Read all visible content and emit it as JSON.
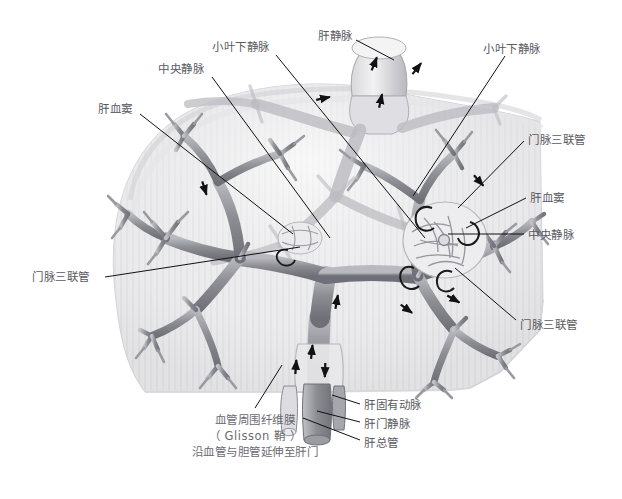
{
  "figure": {
    "background_color": "#ffffff",
    "ink_color": "#5a5a5f",
    "vessel_color": "#8a8a90"
  },
  "labels": [
    {
      "id": "central-vein-top",
      "text": "中央静脉",
      "x": 158,
      "y": 62,
      "leader": "M 212,77 L 330,238"
    },
    {
      "id": "sublobular-vein-top",
      "text": "小叶下静脉",
      "x": 212,
      "y": 40,
      "leader": "M 276,55 L 425,238"
    },
    {
      "id": "hepatic-vein",
      "text": "肝静脉",
      "x": 318,
      "y": 29,
      "leader": "M 356,40 L 394,60"
    },
    {
      "id": "sublobular-vein-right",
      "text": "小叶下静脉",
      "x": 483,
      "y": 42,
      "leader": "M 505,56 L 413,196"
    },
    {
      "id": "hepatic-sinusoid-left",
      "text": "肝血窦",
      "x": 98,
      "y": 102,
      "leader": "M 140,114 L 293,234"
    },
    {
      "id": "portal-triad-right-top",
      "text": "门脉三联管",
      "x": 528,
      "y": 133,
      "leader": "M 524,141 L 458,208"
    },
    {
      "id": "hepatic-sinusoid-right",
      "text": "肝血窦",
      "x": 530,
      "y": 191,
      "leader": "M 526,198 L 466,228"
    },
    {
      "id": "central-vein-right",
      "text": "中央静脉",
      "x": 528,
      "y": 228,
      "leader": "M 524,234 L 448,234"
    },
    {
      "id": "portal-triad-left",
      "text": "门脉三联管",
      "x": 32,
      "y": 270,
      "leader": "M 105,277 L 300,247"
    },
    {
      "id": "portal-triad-right-bot",
      "text": "门脉三联管",
      "x": 520,
      "y": 318,
      "leader": "M 516,320 L 455,268"
    },
    {
      "id": "proper-hepatic-artery",
      "text": "肝固有动脉",
      "x": 364,
      "y": 398,
      "leader": "M 360,404 L 332,395"
    },
    {
      "id": "hepatic-portal-vein",
      "text": "肝门静脉",
      "x": 364,
      "y": 417,
      "leader": "M 360,422 L 317,411"
    },
    {
      "id": "common-hepatic-duct",
      "text": "肝总管",
      "x": 364,
      "y": 436,
      "leader": "M 360,440 L 303,418"
    }
  ],
  "caption": {
    "line1": "血管周围纤维膜",
    "line2": "（ Glisson 鞘 ）",
    "line3": "沿血管与胆管延伸至肝门",
    "x": 255,
    "y": 412,
    "leader": "M 255,408 L 282,365"
  },
  "flow_arrows": [
    {
      "id": "arrow-ivc-up",
      "x": 375,
      "y": 62,
      "angle": -68
    },
    {
      "id": "arrow-hv-left",
      "x": 325,
      "y": 98,
      "angle": -12
    },
    {
      "id": "arrow-hv-right",
      "x": 381,
      "y": 99,
      "angle": -78
    },
    {
      "id": "arrow-hv-branch",
      "x": 418,
      "y": 67,
      "angle": -52
    },
    {
      "id": "arrow-mid-left",
      "x": 205,
      "y": 190,
      "angle": 72
    },
    {
      "id": "arrow-portal-right",
      "x": 480,
      "y": 182,
      "angle": 48
    },
    {
      "id": "arrow-portal-main",
      "x": 337,
      "y": 300,
      "angle": -80
    },
    {
      "id": "arrow-portal-trunk",
      "x": 312,
      "y": 350,
      "angle": -84
    },
    {
      "id": "arrow-artery-up",
      "x": 296,
      "y": 365,
      "angle": -86
    },
    {
      "id": "arrow-duct-down",
      "x": 325,
      "y": 372,
      "angle": 92
    },
    {
      "id": "arrow-right-branch",
      "x": 408,
      "y": 310,
      "angle": 36
    },
    {
      "id": "arrow-lobe-right",
      "x": 455,
      "y": 300,
      "angle": 30
    }
  ],
  "anatomy_notes": {
    "liver_outline": "dome-shaped liver silhouette, pale gray, faint vertical striations",
    "ivc_stump": "inferior vena cava stump at top center",
    "lobule_detail": "magnified hepatic lobule cluster on right with sinusoid network and C-shaped portal triads",
    "portal_tree": "branching portal vein / hepatic artery / bile duct tree filling the liver"
  }
}
